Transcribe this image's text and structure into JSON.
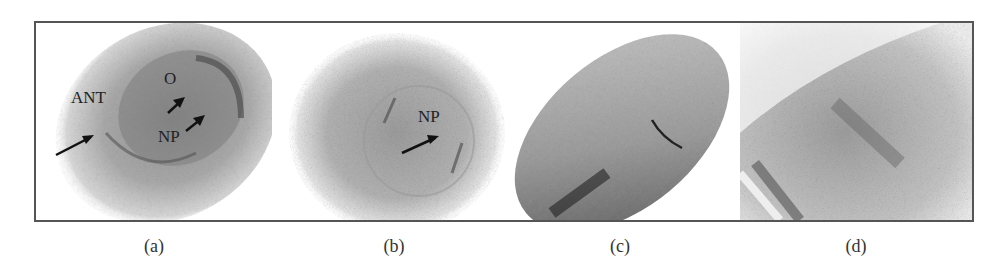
{
  "figure": {
    "panels": [
      {
        "id": "a",
        "label": "(a)",
        "annotations": [
          "ANT",
          "O",
          "NP"
        ]
      },
      {
        "id": "b",
        "label": "(b)",
        "annotations": [
          "NP"
        ]
      },
      {
        "id": "c",
        "label": "(c)",
        "annotations": []
      },
      {
        "id": "d",
        "label": "(d)",
        "annotations": []
      }
    ]
  }
}
